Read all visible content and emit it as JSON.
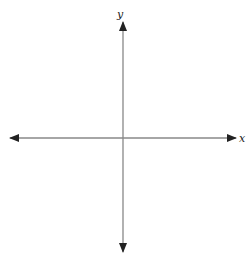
{
  "diagram": {
    "type": "coordinate-axes",
    "x_axis_label": "x",
    "y_axis_label": "y",
    "colors": {
      "axis": "#888888",
      "arrowhead": "#222222",
      "label": "#222222"
    }
  }
}
